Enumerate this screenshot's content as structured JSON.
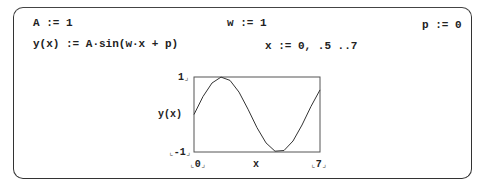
{
  "worksheet": {
    "definitions": [
      {
        "id": "A",
        "text": "A := 1"
      },
      {
        "id": "w",
        "text": "w := 1"
      },
      {
        "id": "p",
        "text": "p := 0"
      },
      {
        "id": "y",
        "text": "y(x) := A·sin(w·x + p)"
      },
      {
        "id": "x",
        "text": "x := 0, .5 ..7"
      }
    ]
  },
  "plot": {
    "y_axis_label": "y(x)",
    "x_axis_label": "x",
    "y_max_label": "1",
    "y_min_label": "-1",
    "x_min_label": "0",
    "x_max_label": "7"
  },
  "chart_data": {
    "type": "line",
    "title": "",
    "xlabel": "x",
    "ylabel": "y(x)",
    "xlim": [
      0,
      7
    ],
    "ylim": [
      -1,
      1
    ],
    "grid": false,
    "series": [
      {
        "name": "y(x) = sin(x)",
        "x": [
          0,
          0.5,
          1,
          1.5,
          2,
          2.5,
          3,
          3.5,
          4,
          4.5,
          5,
          5.5,
          6,
          6.5,
          7
        ],
        "values": [
          0,
          0.479,
          0.841,
          0.997,
          0.909,
          0.598,
          0.141,
          -0.351,
          -0.757,
          -0.978,
          -0.959,
          -0.706,
          -0.279,
          0.215,
          0.657
        ]
      }
    ]
  }
}
